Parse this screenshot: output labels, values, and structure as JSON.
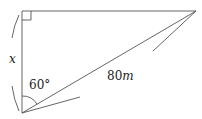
{
  "diagram": {
    "labels": {
      "side_x": "x",
      "hypotenuse": "80m",
      "hyp_num": "80",
      "hyp_unit": "m",
      "angle": "60°"
    },
    "right_angle": true
  }
}
